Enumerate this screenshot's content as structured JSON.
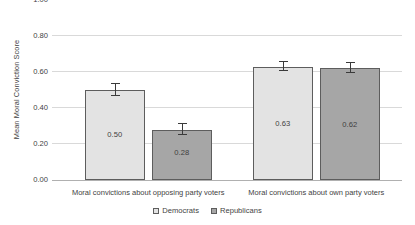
{
  "chart_data": {
    "type": "bar",
    "title": "",
    "xlabel": "",
    "ylabel": "Mean Moral Conviction Score",
    "ylim": [
      0.0,
      1.0
    ],
    "ytick_labels": [
      "1.00",
      "0.80",
      "0.60",
      "0.40",
      "0.20",
      "0.00"
    ],
    "ytick_values": [
      1.0,
      0.8,
      0.6,
      0.4,
      0.2,
      0.0
    ],
    "grid": true,
    "legend_position": "bottom",
    "categories": [
      "Moral convictions about opposing party voters",
      "Moral convictions about own party voters"
    ],
    "series": [
      {
        "name": "Democrats",
        "color": "#e3e3e3",
        "values": [
          0.5,
          0.63
        ],
        "value_labels": [
          "0.50",
          "0.63"
        ],
        "errors": [
          0.035,
          0.025
        ]
      },
      {
        "name": "Republicans",
        "color": "#a6a6a6",
        "values": [
          0.28,
          0.62
        ],
        "value_labels": [
          "0.28",
          "0.62"
        ],
        "errors": [
          0.03,
          0.028
        ]
      }
    ]
  },
  "legend": {
    "items": [
      {
        "label": "Democrats",
        "color": "#e3e3e3"
      },
      {
        "label": "Republicans",
        "color": "#a6a6a6"
      }
    ]
  },
  "axis": {
    "y_title": "Mean Moral Conviction Score"
  }
}
